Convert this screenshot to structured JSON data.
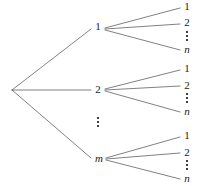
{
  "diagram": {
    "type": "tree",
    "title": "",
    "background_color": "#ffffff",
    "line_color": "#4a4a4a",
    "text_color": "#1a1a1a",
    "root": {
      "label": "",
      "x": 11,
      "y": 90
    },
    "level1": {
      "count_label": "m",
      "nodes": [
        {
          "label": "1",
          "italic": false,
          "x": 98,
          "y": 27
        },
        {
          "label": "2",
          "italic": false,
          "x": 98,
          "y": 90
        },
        {
          "label": "m",
          "italic": true,
          "x": 99,
          "y": 159
        }
      ],
      "ellipsis": {
        "x": 98,
        "y": 122,
        "dots": 3
      }
    },
    "level2": {
      "count_label": "n",
      "groups": [
        {
          "parent": "1",
          "leaves": [
            {
              "label": "1",
              "italic": false,
              "x": 187,
              "y": 7
            },
            {
              "label": "2",
              "italic": false,
              "x": 187,
              "y": 23
            },
            {
              "label": "n",
              "italic": true,
              "x": 187,
              "y": 50
            }
          ],
          "ellipsis": {
            "x": 187,
            "y": 36,
            "dots": 3
          }
        },
        {
          "parent": "2",
          "leaves": [
            {
              "label": "1",
              "italic": false,
              "x": 187,
              "y": 69
            },
            {
              "label": "2",
              "italic": false,
              "x": 187,
              "y": 86
            },
            {
              "label": "n",
              "italic": true,
              "x": 187,
              "y": 112
            }
          ],
          "ellipsis": {
            "x": 187,
            "y": 98,
            "dots": 3
          }
        },
        {
          "parent": "m",
          "leaves": [
            {
              "label": "1",
              "italic": false,
              "x": 187,
              "y": 136
            },
            {
              "label": "2",
              "italic": false,
              "x": 187,
              "y": 153
            },
            {
              "label": "n",
              "italic": true,
              "x": 187,
              "y": 179
            }
          ],
          "ellipsis": {
            "x": 187,
            "y": 165,
            "dots": 3
          }
        }
      ]
    },
    "edges": [
      {
        "from": "root",
        "to": "level1-1",
        "x1": 12,
        "y1": 90,
        "x2": 91,
        "y2": 29
      },
      {
        "from": "root",
        "to": "level1-2",
        "x1": 12,
        "y1": 90,
        "x2": 91,
        "y2": 90
      },
      {
        "from": "root",
        "to": "level1-m",
        "x1": 12,
        "y1": 90,
        "x2": 91,
        "y2": 158
      },
      {
        "from": "level1-1",
        "to": "leaf-1-1",
        "x1": 105,
        "y1": 28,
        "x2": 180,
        "y2": 8
      },
      {
        "from": "level1-1",
        "to": "leaf-1-2",
        "x1": 105,
        "y1": 29,
        "x2": 180,
        "y2": 24
      },
      {
        "from": "level1-1",
        "to": "leaf-1-n",
        "x1": 105,
        "y1": 30,
        "x2": 180,
        "y2": 50
      },
      {
        "from": "level1-2",
        "to": "leaf-2-1",
        "x1": 105,
        "y1": 89,
        "x2": 180,
        "y2": 70
      },
      {
        "from": "level1-2",
        "to": "leaf-2-2",
        "x1": 105,
        "y1": 90,
        "x2": 180,
        "y2": 86
      },
      {
        "from": "level1-2",
        "to": "leaf-2-n",
        "x1": 105,
        "y1": 91,
        "x2": 180,
        "y2": 112
      },
      {
        "from": "level1-m",
        "to": "leaf-m-1",
        "x1": 106,
        "y1": 158,
        "x2": 180,
        "y2": 137
      },
      {
        "from": "level1-m",
        "to": "leaf-m-2",
        "x1": 106,
        "y1": 159,
        "x2": 180,
        "y2": 153
      },
      {
        "from": "level1-m",
        "to": "leaf-m-n",
        "x1": 106,
        "y1": 160,
        "x2": 180,
        "y2": 179
      }
    ]
  }
}
